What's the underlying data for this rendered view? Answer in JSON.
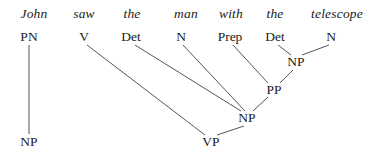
{
  "diagram": {
    "kind": "syntax-tree",
    "sentence": "John saw the man with the telescope",
    "width": 376,
    "height": 158,
    "background_color": "#ffffff",
    "line_color": "#555555",
    "text_color": "#1a1a1a"
  },
  "words": [
    {
      "id": "w1",
      "label": "John",
      "x": 34,
      "y": 14
    },
    {
      "id": "w2",
      "label": "saw",
      "x": 84,
      "y": 14
    },
    {
      "id": "w3",
      "label": "the",
      "x": 132,
      "y": 14
    },
    {
      "id": "w4",
      "label": "man",
      "x": 186,
      "y": 14
    },
    {
      "id": "w5",
      "label": "with",
      "x": 231,
      "y": 14
    },
    {
      "id": "w6",
      "label": "the",
      "x": 275,
      "y": 14
    },
    {
      "id": "w7",
      "label": "telescope",
      "x": 337,
      "y": 14
    }
  ],
  "pos_tags": [
    {
      "id": "p1",
      "label": "PN",
      "x": 29,
      "y": 37
    },
    {
      "id": "p2",
      "label": "V",
      "x": 84,
      "y": 37
    },
    {
      "id": "p3",
      "label": "Det",
      "x": 131,
      "y": 37
    },
    {
      "id": "p4",
      "label": "N",
      "x": 181,
      "y": 37
    },
    {
      "id": "p5",
      "label": "Prep",
      "x": 230,
      "y": 37
    },
    {
      "id": "p6",
      "label": "Det",
      "x": 275,
      "y": 37
    },
    {
      "id": "p7",
      "label": "N",
      "x": 331,
      "y": 37
    }
  ],
  "phrases": [
    {
      "id": "np_tel",
      "label": "NP",
      "x": 296,
      "y": 62
    },
    {
      "id": "pp",
      "label": "PP",
      "x": 274,
      "y": 90
    },
    {
      "id": "np_obj",
      "label": "NP",
      "x": 247,
      "y": 118
    },
    {
      "id": "vp",
      "label": "VP",
      "x": 211,
      "y": 142
    },
    {
      "id": "np_subj",
      "label": "NP",
      "x": 29,
      "y": 142
    }
  ],
  "edges": [
    {
      "id": "e1",
      "from": "p1",
      "to": "np_subj",
      "x1": 29,
      "y1": 45,
      "x2": 29,
      "y2": 134
    },
    {
      "id": "e2",
      "from": "p6",
      "to": "np_tel",
      "x1": 278,
      "y1": 45,
      "x2": 291,
      "y2": 55
    },
    {
      "id": "e3",
      "from": "p7",
      "to": "np_tel",
      "x1": 329,
      "y1": 45,
      "x2": 302,
      "y2": 55
    },
    {
      "id": "e4",
      "from": "p5",
      "to": "pp",
      "x1": 233,
      "y1": 45,
      "x2": 268,
      "y2": 83
    },
    {
      "id": "e5",
      "from": "np_tel",
      "to": "pp",
      "x1": 293,
      "y1": 70,
      "x2": 280,
      "y2": 83
    },
    {
      "id": "e6",
      "from": "p3",
      "to": "np_obj",
      "x1": 135,
      "y1": 45,
      "x2": 241,
      "y2": 111
    },
    {
      "id": "e7",
      "from": "p4",
      "to": "np_obj",
      "x1": 183,
      "y1": 45,
      "x2": 245,
      "y2": 111
    },
    {
      "id": "e8",
      "from": "pp",
      "to": "np_obj",
      "x1": 268,
      "y1": 97,
      "x2": 253,
      "y2": 111
    },
    {
      "id": "e9",
      "from": "p2",
      "to": "vp",
      "x1": 87,
      "y1": 45,
      "x2": 205,
      "y2": 135
    },
    {
      "id": "e10",
      "from": "np_obj",
      "to": "vp",
      "x1": 244,
      "y1": 126,
      "x2": 217,
      "y2": 135
    }
  ]
}
